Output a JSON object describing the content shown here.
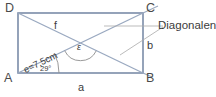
{
  "figure": {
    "vertices": [
      {
        "name": "D",
        "label": "D",
        "x": 6,
        "y": 6
      },
      {
        "name": "C",
        "label": "C",
        "x": 146,
        "y": 6
      },
      {
        "name": "A",
        "label": "A",
        "x": 4,
        "y": 76
      },
      {
        "name": "B",
        "label": "B",
        "x": 146,
        "y": 76
      }
    ],
    "sides": [
      {
        "name": "a",
        "label": "a"
      },
      {
        "name": "b",
        "label": "b"
      }
    ],
    "diagonals": [
      {
        "name": "e",
        "label": "e=7,5cm",
        "value": 7.5,
        "unit": "cm"
      },
      {
        "name": "f",
        "label": "f"
      }
    ],
    "angles": [
      {
        "name": "alpha-at-A",
        "label": "29°",
        "value": 29,
        "unit": "°"
      },
      {
        "name": "epsilon",
        "label": "ε"
      }
    ],
    "callout": {
      "label": "Diagonalen"
    },
    "colors": {
      "rectangle_stroke": "#7b8ca8",
      "diagonal_stroke": "#9aa9c0",
      "leader_stroke": "#a9a9a9",
      "arc_stroke": "#8f8f8f",
      "text": "#3c3c3c",
      "background": "#ffffff"
    },
    "geometry": {
      "rect": {
        "left": 18,
        "top": 13,
        "right": 143,
        "bottom": 73
      },
      "center": {
        "x": 80.5,
        "y": 43
      }
    }
  }
}
